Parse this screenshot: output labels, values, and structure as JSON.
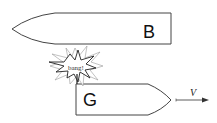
{
  "diagram": {
    "boats": [
      {
        "id": "B",
        "label": "B",
        "heading": "left"
      },
      {
        "id": "G",
        "label": "G",
        "heading": "right"
      }
    ],
    "collision": {
      "label": "bang!"
    },
    "velocity": {
      "label": "V",
      "direction": "right"
    },
    "colors": {
      "stroke": "#444444",
      "background": "#ffffff"
    }
  }
}
